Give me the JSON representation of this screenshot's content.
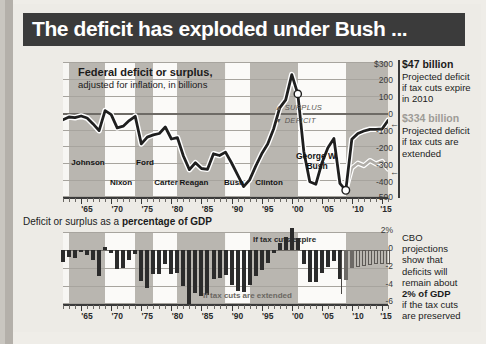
{
  "title": "The deficit has exploded under Bush ...",
  "top_chart": {
    "title": "Federal deficit or surplus,",
    "subtitle": "adjusted for inflation, in billions",
    "legend_surplus": "SURPLUS",
    "legend_deficit": "DEFICIT",
    "gwb_label_line1": "George W.",
    "gwb_label_line2": "Bush",
    "y_ticks": [
      "$300",
      "200",
      "100",
      "0",
      "-100",
      "-200",
      "-300",
      "-400",
      "-500"
    ],
    "x_ticks": [
      "'65",
      "'70",
      "'75",
      "'80",
      "'85",
      "'90",
      "'95",
      "'00",
      "'05",
      "'10",
      "'15"
    ],
    "presidents": [
      "Johnson",
      "Nixon",
      "Ford",
      "Carter",
      "Reagan",
      "Bush",
      "Clinton"
    ]
  },
  "annotations_top": [
    {
      "amount": "$47 billion",
      "text": "Projected deficit if tax cuts expire in 2010",
      "style": "dark"
    },
    {
      "amount": "$334 billion",
      "text": "Projected deficit if tax cuts are extended",
      "style": "gray"
    }
  ],
  "bottom_chart": {
    "heading_plain": "Deficit or surplus as a ",
    "heading_bold": "percentage of GDP",
    "note_expire": "If tax cuts expire",
    "note_extended": "If tax cuts are extended",
    "y_ticks": [
      "2%",
      "0",
      "-2",
      "-4",
      "-6"
    ],
    "x_ticks": [
      "'65",
      "'70",
      "'75",
      "'80",
      "'85",
      "'90",
      "'95",
      "'00",
      "'05",
      "'10",
      "'15"
    ]
  },
  "annotation_bottom": {
    "line1": "CBO",
    "line2": "projections",
    "line3": "show that",
    "line4": "deficits will",
    "line5": "remain about",
    "line6_bold": "2% of GDP",
    "line7": "if the tax cuts",
    "line8": "are preserved"
  },
  "colors": {
    "banner_bg": "#3b3b3b",
    "banner_text": "#ffffff",
    "paper": "#edebe6",
    "plot_bg": "#f7f6f3",
    "band_dark": "#b9b6b0",
    "line_dark": "#1f1f1f",
    "line_light": "#b0ada8",
    "bar": "#2b2b2b",
    "gridline": "#a7a49e"
  },
  "chart_data": [
    {
      "type": "line",
      "title": "Federal deficit or surplus, adjusted for inflation, in billions",
      "xlabel": "",
      "ylabel": "billions of dollars (inflation adjusted)",
      "ylim": [
        -500,
        300
      ],
      "xlim": [
        1962,
        2016
      ],
      "grid": true,
      "legend": [
        "SURPLUS",
        "DEFICIT"
      ],
      "x": [
        1962,
        1963,
        1964,
        1965,
        1966,
        1967,
        1968,
        1969,
        1970,
        1971,
        1972,
        1973,
        1974,
        1975,
        1976,
        1977,
        1978,
        1979,
        1980,
        1981,
        1982,
        1983,
        1984,
        1985,
        1986,
        1987,
        1988,
        1989,
        1990,
        1991,
        1992,
        1993,
        1994,
        1995,
        1996,
        1997,
        1998,
        1999,
        2000,
        2001,
        2002,
        2003,
        2004,
        2005,
        2006,
        2007,
        2008,
        2009,
        2010,
        2011,
        2012,
        2013,
        2014,
        2015,
        2016
      ],
      "series": [
        {
          "name": "Actual / if tax cuts expire in 2010",
          "values": [
            -42,
            -26,
            -30,
            -8,
            -20,
            -55,
            -95,
            12,
            -12,
            -90,
            -78,
            -45,
            -22,
            -185,
            -145,
            -122,
            -110,
            -72,
            -145,
            -140,
            -255,
            -335,
            -295,
            -330,
            -335,
            -245,
            -255,
            -235,
            -300,
            -370,
            -440,
            -400,
            -320,
            -255,
            -185,
            -95,
            28,
            75,
            225,
            110,
            -230,
            -410,
            -425,
            -300,
            -210,
            -155,
            -420,
            -460,
            -100,
            -65,
            -50,
            -40,
            -40,
            -38,
            -47
          ]
        },
        {
          "name": "If tax cuts are extended",
          "values": [
            null,
            null,
            null,
            null,
            null,
            null,
            null,
            null,
            null,
            null,
            null,
            null,
            null,
            null,
            null,
            null,
            null,
            null,
            null,
            null,
            null,
            null,
            null,
            null,
            null,
            null,
            null,
            null,
            null,
            null,
            null,
            null,
            null,
            null,
            null,
            null,
            null,
            null,
            null,
            null,
            null,
            null,
            null,
            null,
            null,
            null,
            null,
            -460,
            -330,
            -300,
            -315,
            -285,
            -320,
            -300,
            -334
          ]
        }
      ],
      "presidents": [
        {
          "name": "Johnson",
          "start": 1963,
          "end": 1969
        },
        {
          "name": "Nixon",
          "start": 1969,
          "end": 1974
        },
        {
          "name": "Ford",
          "start": 1974,
          "end": 1977
        },
        {
          "name": "Carter",
          "start": 1977,
          "end": 1981
        },
        {
          "name": "Reagan",
          "start": 1981,
          "end": 1989
        },
        {
          "name": "Bush",
          "start": 1989,
          "end": 1993
        },
        {
          "name": "Clinton",
          "start": 1993,
          "end": 2001
        },
        {
          "name": "George W. Bush",
          "start": 2001,
          "end": 2009
        }
      ],
      "annotations": [
        {
          "label": "$47 billion",
          "text": "Projected deficit if tax cuts expire in 2010",
          "value": -47,
          "year": 2016
        },
        {
          "label": "$334 billion",
          "text": "Projected deficit if tax cuts are extended",
          "value": -334,
          "year": 2016
        }
      ]
    },
    {
      "type": "bar",
      "title": "Deficit or surplus as a percentage of GDP",
      "xlabel": "",
      "ylabel": "percent of GDP",
      "ylim": [
        -6,
        2
      ],
      "grid": true,
      "categories": [
        1962,
        1963,
        1964,
        1965,
        1966,
        1967,
        1968,
        1969,
        1970,
        1971,
        1972,
        1973,
        1974,
        1975,
        1976,
        1977,
        1978,
        1979,
        1980,
        1981,
        1982,
        1983,
        1984,
        1985,
        1986,
        1987,
        1988,
        1989,
        1990,
        1991,
        1992,
        1993,
        1994,
        1995,
        1996,
        1997,
        1998,
        1999,
        2000,
        2001,
        2002,
        2003,
        2004,
        2005,
        2006,
        2007,
        2008,
        2009,
        2010,
        2011,
        2012,
        2013,
        2014,
        2015,
        2016
      ],
      "values": [
        -1.3,
        -0.8,
        -0.9,
        -0.2,
        -0.5,
        -1.1,
        -2.9,
        0.3,
        -0.3,
        -2.1,
        -2.0,
        -1.1,
        -0.4,
        -3.4,
        -4.2,
        -2.7,
        -2.7,
        -1.6,
        -2.7,
        -2.6,
        -4.0,
        -6.0,
        -4.8,
        -5.1,
        -5.0,
        -3.2,
        -3.1,
        -2.8,
        -3.9,
        -4.5,
        -4.7,
        -3.9,
        -2.9,
        -2.2,
        -1.4,
        -0.3,
        0.8,
        1.4,
        2.4,
        1.3,
        -1.5,
        -3.5,
        -3.6,
        -2.6,
        -1.9,
        -1.2,
        -3.2,
        -3.3,
        -2.0,
        -1.9,
        -1.8,
        -1.7,
        -1.6,
        -1.5,
        -1.5
      ],
      "projection_start": 2009,
      "notes": [
        "If tax cuts expire",
        "If tax cuts are extended"
      ],
      "annotation": "CBO projections show that deficits will remain about 2% of GDP if the tax cuts are preserved"
    }
  ]
}
